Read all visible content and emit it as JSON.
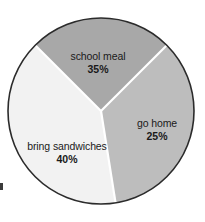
{
  "chart_data": {
    "type": "pie",
    "title": "",
    "subtitle": "",
    "xlabel": "",
    "ylabel": "",
    "legend_position": "none",
    "labels_inside_slices": true,
    "categories": [
      "school meal",
      "go home",
      "bring sandwiches"
    ],
    "values": [
      35,
      25,
      40
    ],
    "value_unit": "%",
    "slices": [
      {
        "name": "school meal",
        "value": 35,
        "value_label": "35%",
        "color": "#bdbdbd",
        "position": "top"
      },
      {
        "name": "go home",
        "value": 25,
        "value_label": "25%",
        "color": "#a8a8a8",
        "position": "right"
      },
      {
        "name": "bring sandwiches",
        "value": 40,
        "value_label": "40%",
        "color": "#f2f2f2",
        "position": "left-bottom"
      }
    ],
    "total": 100,
    "geometry": {
      "center_x": 101,
      "center_y": 111,
      "radius": 93,
      "outline_color": "#2b2b2b",
      "divider_color": "#ffffff",
      "background": "#ffffff"
    }
  },
  "figure": {
    "labels": {
      "school_meal_name": "school meal",
      "school_meal_pct": "35%",
      "go_home_name": "go home",
      "go_home_pct": "25%",
      "bring_sandwiches_name": "bring sandwiches",
      "bring_sandwiches_pct": "40%"
    }
  }
}
